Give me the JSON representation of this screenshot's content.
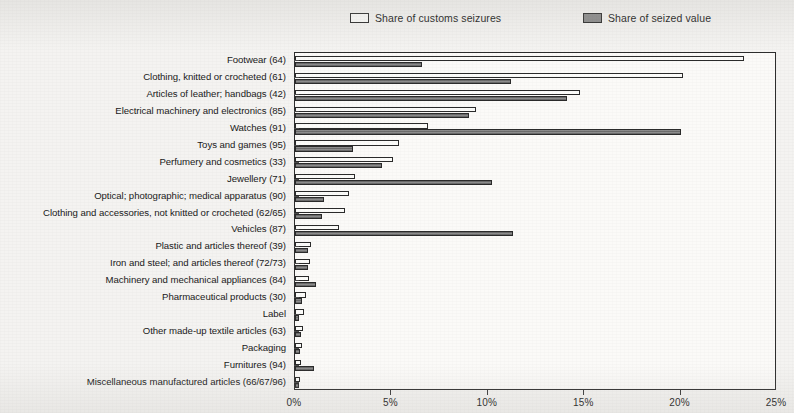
{
  "legend": {
    "items": [
      {
        "label": "Share of customs seizures",
        "swatch": "light-square-icon",
        "color": "#fbfbf9"
      },
      {
        "label": "Share of seized value",
        "swatch": "dark-square-icon",
        "color": "#8a8a8a"
      }
    ]
  },
  "axis": {
    "ticks": [
      "0%",
      "5%",
      "10%",
      "15%",
      "20%",
      "25%"
    ],
    "min": 0,
    "max": 25
  },
  "chart_data": {
    "type": "bar",
    "orientation": "horizontal",
    "title": "",
    "subtitle": "",
    "xlabel": "",
    "ylabel": "",
    "xlim": [
      0,
      25
    ],
    "xticks": [
      0,
      5,
      10,
      15,
      20,
      25
    ],
    "xtick_labels": [
      "0%",
      "5%",
      "10%",
      "15%",
      "20%",
      "25%"
    ],
    "grid": false,
    "legend_position": "top",
    "unit": "%",
    "categories": [
      "Footwear (64)",
      "Clothing, knitted or crocheted (61)",
      "Articles of leather; handbags (42)",
      "Electrical machinery and electronics (85)",
      "Watches (91)",
      "Toys and games (95)",
      "Perfumery and cosmetics (33)",
      "Jewellery (71)",
      "Optical; photographic; medical apparatus (90)",
      "Clothing and accessories, not knitted or crocheted (62/65)",
      "Vehicles (87)",
      "Plastic and articles thereof (39)",
      "Iron and steel; and articles thereof (72/73)",
      "Machinery and mechanical appliances (84)",
      "Pharmaceutical products (30)",
      "Label",
      "Other made-up textile articles (63)",
      "Packaging",
      "Furnitures (94)",
      "Miscellaneous manufactured articles (66/67/96)"
    ],
    "series": [
      {
        "name": "Share of customs seizures",
        "color": "#fbfbf9",
        "values": [
          23.3,
          20.1,
          14.8,
          9.4,
          6.9,
          5.4,
          5.1,
          3.1,
          2.8,
          2.6,
          2.3,
          0.85,
          0.8,
          0.75,
          0.55,
          0.45,
          0.4,
          0.35,
          0.3,
          0.25
        ]
      },
      {
        "name": "Share of seized value",
        "color": "#7f7f7f",
        "values": [
          6.6,
          11.2,
          14.1,
          9.0,
          20.0,
          3.0,
          4.5,
          10.2,
          1.5,
          1.4,
          11.3,
          0.7,
          0.65,
          1.1,
          0.35,
          0.2,
          0.3,
          0.25,
          1.0,
          0.2
        ]
      }
    ]
  }
}
